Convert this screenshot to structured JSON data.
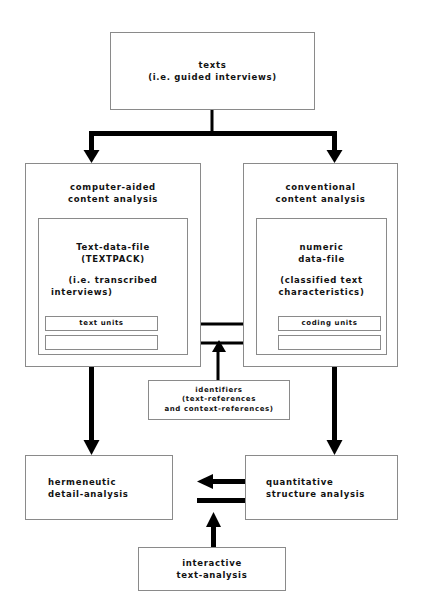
{
  "diagram": {
    "colors": {
      "box_border": "#8a8a8a",
      "connector": "#000000",
      "text": "#121212",
      "background": "#ffffff"
    },
    "nodes": {
      "texts": {
        "line1": "texts",
        "line2": "(i.e. guided interviews)"
      },
      "computer_aided": {
        "line1": "computer-aided",
        "line2": "content analysis"
      },
      "conventional": {
        "line1": "conventional",
        "line2": "content analysis"
      },
      "text_data_file": {
        "line1": "Text-data-file",
        "line2": "(TEXTPACK)",
        "line3": "(i.e. transcribed",
        "line4": "interviews)"
      },
      "numeric_data_file": {
        "line1": "numeric",
        "line2": "data-file",
        "line3": "(classified text",
        "line4": "characteristics)"
      },
      "text_units": "text units",
      "coding_units": "coding units",
      "text_units_empty": "",
      "coding_units_empty": "",
      "identifiers": {
        "line1": "identifiers",
        "line2": "(text-references",
        "line3": "and context-references)"
      },
      "hermeneutic": {
        "line1": "hermeneutic",
        "line2": "detail-analysis"
      },
      "quantitative": {
        "line1": "quantitative",
        "line2": "structure analysis"
      },
      "interactive": {
        "line1": "interactive",
        "line2": "text-analysis"
      }
    },
    "connectors": [
      {
        "name": "texts-to-split",
        "from": "texts",
        "to": "split-bar",
        "style": "thick-line"
      },
      {
        "name": "split-to-computer-aided",
        "from": "split-bar",
        "to": "computer_aided",
        "style": "thick-arrow-down"
      },
      {
        "name": "split-to-conventional",
        "from": "split-bar",
        "to": "conventional",
        "style": "thick-arrow-down"
      },
      {
        "name": "text-units-coding-units-upper",
        "from": "text_units",
        "to": "coding_units",
        "style": "double-arrow-horizontal"
      },
      {
        "name": "text-units-coding-units-lower",
        "from": "text_units_empty",
        "to": "coding_units_empty",
        "style": "double-arrow-horizontal"
      },
      {
        "name": "identifiers-up",
        "from": "identifiers",
        "to": "unit-links",
        "style": "thin-arrow-up"
      },
      {
        "name": "computer-aided-to-hermeneutic",
        "from": "computer_aided",
        "to": "hermeneutic",
        "style": "thick-arrow-down"
      },
      {
        "name": "conventional-to-quantitative",
        "from": "conventional",
        "to": "quantitative",
        "style": "thick-arrow-down"
      },
      {
        "name": "quantitative-to-hermeneutic",
        "from": "quantitative",
        "to": "hermeneutic",
        "style": "thick-arrow-left"
      },
      {
        "name": "hermeneutic-to-quantitative",
        "from": "hermeneutic",
        "to": "quantitative",
        "style": "thick-arrow-right"
      },
      {
        "name": "interactive-up",
        "from": "interactive",
        "to": "bottom-exchange",
        "style": "thick-arrow-up"
      }
    ]
  }
}
